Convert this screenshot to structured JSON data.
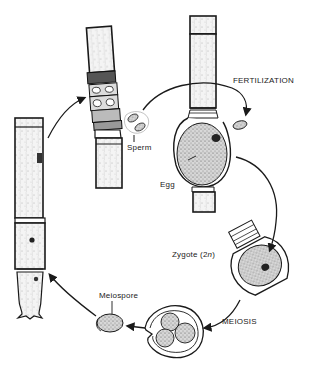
{
  "diagram": {
    "type": "life-cycle",
    "labels": {
      "fertilization": "FERTILIZATION",
      "sperm": "Sperm",
      "egg": "Egg",
      "zygote": "Zygote (2",
      "zygote_n": "n",
      "zygote_close": ")",
      "meiosis": "MEIOSIS",
      "meiospore": "Meiospore"
    },
    "stages": [
      {
        "id": "filament-with-antheridia",
        "label": "Sperm"
      },
      {
        "id": "filament-with-oogonium",
        "label": "Egg"
      },
      {
        "id": "fertilization",
        "label": "FERTILIZATION"
      },
      {
        "id": "zygote",
        "label": "Zygote (2n)"
      },
      {
        "id": "meiosis",
        "label": "MEIOSIS"
      },
      {
        "id": "meiospore",
        "label": "Meiospore"
      },
      {
        "id": "young-filament",
        "label": ""
      }
    ],
    "colors": {
      "ink": "#1a1a1a",
      "stipple": "#8a8a8a",
      "background": "#ffffff"
    }
  }
}
